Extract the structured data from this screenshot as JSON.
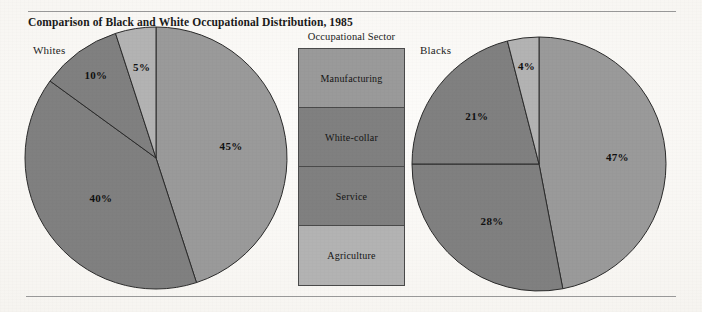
{
  "figure": {
    "title": "Comparison of Black and White Occupational Distribution, 1985"
  },
  "legend": {
    "title": "Occupational Sector",
    "items": [
      {
        "label": "Manufacturing",
        "color": "#9a9a9a"
      },
      {
        "label": "White-collar",
        "color": "#808080"
      },
      {
        "label": "Service",
        "color": "#808080"
      },
      {
        "label": "Agriculture",
        "color": "#b3b3b3"
      }
    ]
  },
  "pies": {
    "whites": {
      "group_label": "Whites",
      "labels": [
        "45%",
        "40%",
        "10%",
        "5%"
      ]
    },
    "blacks": {
      "group_label": "Blacks",
      "labels": [
        "47%",
        "28%",
        "21%",
        "4%"
      ]
    }
  },
  "chart_data": [
    {
      "type": "pie",
      "title": "Whites",
      "categories": [
        "Manufacturing",
        "White-collar",
        "Service",
        "Agriculture"
      ],
      "values": [
        45,
        40,
        10,
        5
      ],
      "labels": [
        "45%",
        "40%",
        "10%",
        "5%"
      ],
      "colors": [
        "#9a9a9a",
        "#808080",
        "#808080",
        "#b3b3b3"
      ],
      "start_angle_deg": 0,
      "direction": "clockwise",
      "legend": "Occupational Sector"
    },
    {
      "type": "pie",
      "title": "Blacks",
      "categories": [
        "Manufacturing",
        "White-collar",
        "Service",
        "Agriculture"
      ],
      "values": [
        47,
        28,
        21,
        4
      ],
      "labels": [
        "47%",
        "28%",
        "21%",
        "4%"
      ],
      "colors": [
        "#9a9a9a",
        "#808080",
        "#808080",
        "#b3b3b3"
      ],
      "start_angle_deg": 0,
      "direction": "clockwise",
      "legend": "Occupational Sector"
    }
  ]
}
